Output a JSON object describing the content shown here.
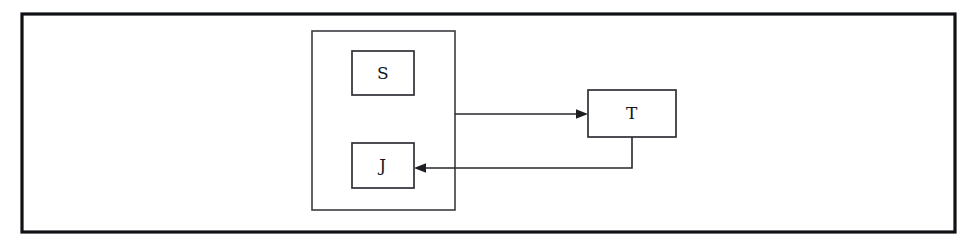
{
  "diagram": {
    "background_color": "#ffffff",
    "frame": {
      "name": "outer-frame",
      "x": 22,
      "y": 14,
      "width": 933,
      "height": 218,
      "stroke_color": "#101114",
      "stroke_width": 3.2,
      "fill_color": "#ffffff"
    },
    "group": {
      "name": "inner-container",
      "label": "",
      "x": 312,
      "y": 31,
      "width": 143,
      "height": 179,
      "stroke_color": "#3a3c42",
      "stroke_width": 1.6
    },
    "nodes": [
      {
        "id": "S",
        "label": "S",
        "x": 352,
        "y": 51,
        "width": 62,
        "height": 44,
        "stroke_color": "#2e3035",
        "fill_color": "#ffffff"
      },
      {
        "id": "J",
        "label": "J",
        "x": 352,
        "y": 143,
        "width": 62,
        "height": 45,
        "stroke_color": "#2e3035",
        "fill_color": "#ffffff"
      },
      {
        "id": "T",
        "label": "T",
        "x": 588,
        "y": 90,
        "width": 88,
        "height": 47,
        "stroke_color": "#2e3035",
        "fill_color": "#ffffff"
      }
    ],
    "edges": [
      {
        "id": "group-to-T",
        "from": "inner-container",
        "to": "T",
        "label": "",
        "path": "M 455 114 L 581 114",
        "arrow_direction": "right",
        "arrow_tip_x": 588,
        "arrow_tip_y": 114,
        "stroke_color": "#26282d",
        "stroke_width": 1.6
      },
      {
        "id": "T-to-J",
        "from": "T",
        "to": "J",
        "label": "",
        "path": "M 632 137 L 632 168 L 421 168",
        "arrow_direction": "left",
        "arrow_tip_x": 414,
        "arrow_tip_y": 168,
        "stroke_color": "#26282d",
        "stroke_width": 1.6
      }
    ]
  }
}
